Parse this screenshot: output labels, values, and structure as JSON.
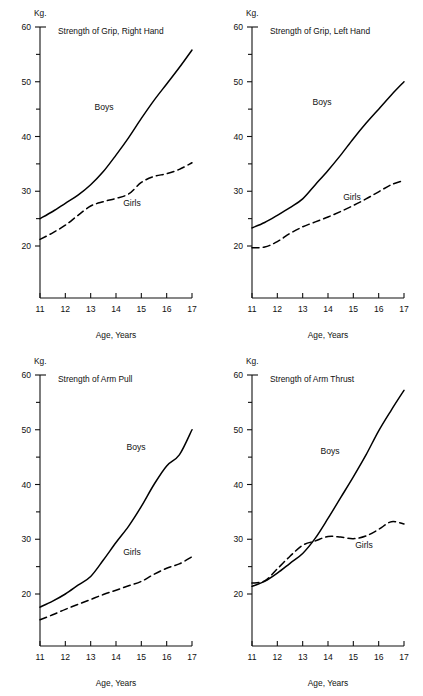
{
  "figure": {
    "unit_label": "Kg.",
    "x_axis_label": "Age, Years",
    "series_labels": {
      "boys": "Boys",
      "girls": "Girls"
    },
    "y_ticks_major": [
      "60",
      "50",
      "40",
      "30",
      "20"
    ],
    "x_ticks": [
      "11",
      "12",
      "13",
      "14",
      "15",
      "16",
      "17"
    ],
    "line_color": "#000000",
    "background_color": "#ffffff"
  },
  "chart_data": [
    {
      "type": "line",
      "title": "Strength of Grip, Right Hand",
      "xlabel": "Age, Years",
      "ylabel": "Kg.",
      "xlim": [
        11,
        17
      ],
      "ylim": [
        17,
        60
      ],
      "grid": false,
      "legend": "inline-labels",
      "y_ticks_major": [
        20,
        30,
        40,
        50,
        60
      ],
      "y_ticks_minor": [
        25,
        35,
        45,
        55
      ],
      "x": [
        11,
        11.5,
        12,
        12.5,
        13,
        13.5,
        14,
        14.5,
        15,
        15.5,
        16,
        16.5,
        17
      ],
      "series": [
        {
          "name": "Boys",
          "style": "solid",
          "values": [
            25.0,
            26.3,
            27.8,
            29.3,
            31.2,
            33.6,
            36.6,
            39.8,
            43.3,
            46.6,
            49.6,
            52.6,
            55.8
          ]
        },
        {
          "name": "Girls",
          "style": "dashed",
          "values": [
            21.2,
            22.4,
            23.8,
            25.6,
            27.3,
            28.1,
            28.7,
            29.5,
            31.6,
            32.7,
            33.2,
            34.0,
            35.2
          ]
        }
      ]
    },
    {
      "type": "line",
      "title": "Strength of Grip, Left Hand",
      "xlabel": "Age, Years",
      "ylabel": "Kg.",
      "xlim": [
        11,
        17
      ],
      "ylim": [
        17,
        60
      ],
      "grid": false,
      "legend": "inline-labels",
      "y_ticks_major": [
        20,
        30,
        40,
        50,
        60
      ],
      "y_ticks_minor": [
        25,
        35,
        45,
        55
      ],
      "x": [
        11,
        11.5,
        12,
        12.5,
        13,
        13.5,
        14,
        14.5,
        15,
        15.5,
        16,
        16.5,
        17
      ],
      "series": [
        {
          "name": "Boys",
          "style": "solid",
          "values": [
            23.3,
            24.3,
            25.6,
            27.0,
            28.6,
            31.2,
            33.8,
            36.6,
            39.6,
            42.4,
            45.0,
            47.6,
            50.0
          ]
        },
        {
          "name": "Girls",
          "style": "dashed",
          "values": [
            19.7,
            19.8,
            20.8,
            22.3,
            23.5,
            24.4,
            25.3,
            26.3,
            27.4,
            28.6,
            29.9,
            31.2,
            32.0
          ]
        }
      ]
    },
    {
      "type": "line",
      "title": "Strength of Arm Pull",
      "xlabel": "Age, Years",
      "ylabel": "Kg.",
      "xlim": [
        11,
        17
      ],
      "ylim": [
        14,
        60
      ],
      "grid": false,
      "legend": "inline-labels",
      "y_ticks_major": [
        20,
        30,
        40,
        50,
        60
      ],
      "y_ticks_minor": [
        25,
        35,
        45,
        55
      ],
      "x": [
        11,
        11.5,
        12,
        12.5,
        13,
        13.5,
        14,
        14.5,
        15,
        15.5,
        16,
        16.5,
        17
      ],
      "series": [
        {
          "name": "Boys",
          "style": "solid",
          "values": [
            17.6,
            18.7,
            20.0,
            21.6,
            23.2,
            26.2,
            29.4,
            32.4,
            36.0,
            40.0,
            43.4,
            45.4,
            50.0
          ]
        },
        {
          "name": "Girls",
          "style": "dashed",
          "values": [
            15.3,
            16.2,
            17.2,
            18.1,
            19.0,
            19.9,
            20.7,
            21.5,
            22.3,
            23.6,
            24.7,
            25.5,
            26.8
          ]
        }
      ]
    },
    {
      "type": "line",
      "title": "Strength of Arm Thrust",
      "xlabel": "Age, Years",
      "ylabel": "Kg.",
      "xlim": [
        11,
        17
      ],
      "ylim": [
        17,
        60
      ],
      "grid": false,
      "legend": "inline-labels",
      "y_ticks_major": [
        20,
        30,
        40,
        50,
        60
      ],
      "y_ticks_minor": [
        25,
        35,
        45,
        55
      ],
      "x": [
        11,
        11.5,
        12,
        12.5,
        13,
        13.5,
        14,
        14.5,
        15,
        15.5,
        16,
        16.5,
        17
      ],
      "series": [
        {
          "name": "Boys",
          "style": "solid",
          "values": [
            21.4,
            22.3,
            23.8,
            25.6,
            27.4,
            30.2,
            33.8,
            37.6,
            41.4,
            45.4,
            49.8,
            53.6,
            57.2
          ]
        },
        {
          "name": "Girls",
          "style": "dashed",
          "values": [
            22.0,
            22.4,
            24.6,
            26.9,
            28.9,
            29.7,
            30.5,
            30.4,
            30.1,
            30.6,
            31.8,
            33.2,
            32.8
          ]
        }
      ]
    }
  ]
}
